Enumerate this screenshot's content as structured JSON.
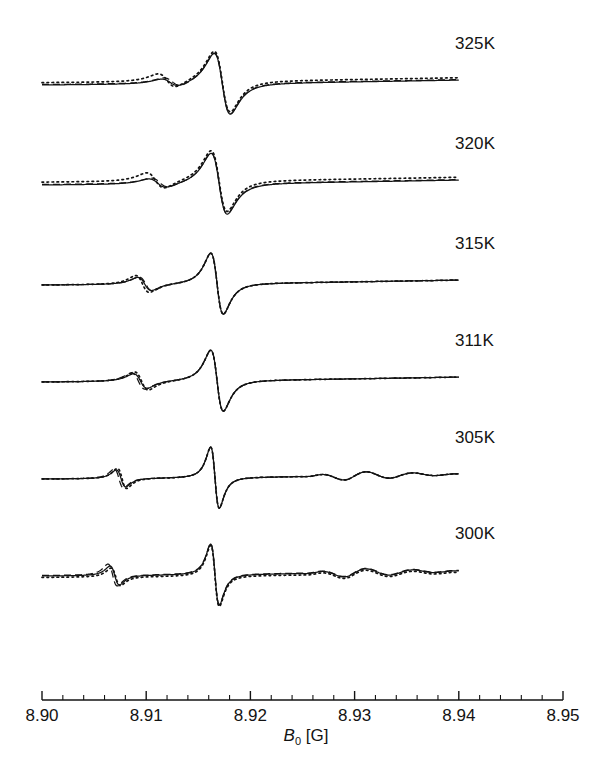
{
  "figure": {
    "kind": "epr-derivative-spectra-stack",
    "background": "#ffffff",
    "ink": "#131313"
  },
  "axis": {
    "title_symbol": "B",
    "title_sub": "0",
    "title_unit": "[G]",
    "title_plain": "B0 [G]",
    "tick_labels": [
      "8.90",
      "8.91",
      "8.92",
      "8.93",
      "8.94",
      "8.95"
    ],
    "tick_values": [
      8.9,
      8.91,
      8.92,
      8.93,
      8.94,
      8.95
    ],
    "minor_tick_step": 0.002,
    "minor_ticks_between_majors": 4,
    "range": [
      8.9,
      8.95
    ],
    "tick_direction": "up",
    "line_color": "#131313"
  },
  "legend": {
    "styles": [
      {
        "name": "experiment",
        "dash": "solid"
      },
      {
        "name": "simulation-a",
        "dash": "dashed"
      },
      {
        "name": "simulation-b",
        "dash": "dotted"
      }
    ]
  },
  "panels": [
    {
      "label": "325K",
      "label_x": 455,
      "label_y": 34,
      "baseline_y": 85
    },
    {
      "label": "320K",
      "label_x": 455,
      "label_y": 134,
      "baseline_y": 185
    },
    {
      "label": "315K",
      "label_x": 455,
      "label_y": 234,
      "baseline_y": 285
    },
    {
      "label": "311K",
      "label_x": 455,
      "label_y": 331,
      "baseline_y": 382
    },
    {
      "label": "305K",
      "label_x": 455,
      "label_y": 428,
      "baseline_y": 479
    },
    {
      "label": "300K",
      "label_x": 455,
      "label_y": 524,
      "baseline_y": 576
    }
  ],
  "chart_data": {
    "type": "line",
    "title": "",
    "xlabel": "B0 [G]",
    "ylabel": "",
    "xlim": [
      8.9,
      8.95
    ],
    "grid": false,
    "legend_position": "none",
    "x_tick_values": [
      8.9,
      8.91,
      8.92,
      8.93,
      8.94,
      8.95
    ],
    "x_tick_labels": [
      "8.90",
      "8.91",
      "8.92",
      "8.93",
      "8.94",
      "8.95"
    ],
    "trace_x_start": 8.9,
    "trace_x_end": 8.94,
    "series": [
      {
        "name": "325K",
        "temperature_K": 325,
        "main_peak_x": 8.9153,
        "main_zero_x": 8.9173,
        "main_trough_x": 8.9192,
        "satellite_peak_x": 8.911,
        "satellite_amplitude": 0.16,
        "main_amplitude": 1.0,
        "linewidth_class": "broad",
        "styles": {
          "solid": {
            "satellite_amplitude": 0.13,
            "satellite_peak_x": 8.9108,
            "baseline_offset": 0.0
          },
          "dashed": {
            "satellite_amplitude": 0.15,
            "satellite_peak_x": 8.911,
            "baseline_offset": 0.01
          },
          "dotted": {
            "satellite_amplitude": 0.23,
            "satellite_peak_x": 8.9105,
            "baseline_offset": 0.05
          }
        }
      },
      {
        "name": "320K",
        "temperature_K": 320,
        "main_peak_x": 8.915,
        "main_zero_x": 8.917,
        "main_trough_x": 8.919,
        "satellite_peak_x": 8.9098,
        "satellite_amplitude": 0.18,
        "main_amplitude": 1.0,
        "linewidth_class": "broad",
        "styles": {
          "solid": {
            "satellite_amplitude": 0.15,
            "satellite_peak_x": 8.9096,
            "baseline_offset": 0.0
          },
          "dashed": {
            "satellite_amplitude": 0.16,
            "satellite_peak_x": 8.9098,
            "baseline_offset": 0.01
          },
          "dotted": {
            "satellite_amplitude": 0.26,
            "satellite_peak_x": 8.9094,
            "baseline_offset": 0.06
          }
        }
      },
      {
        "name": "315K",
        "temperature_K": 315,
        "main_peak_x": 8.9152,
        "main_zero_x": 8.9168,
        "main_trough_x": 8.9186,
        "satellite_peak_x": 8.9088,
        "satellite_amplitude": 0.24,
        "main_amplitude": 1.0,
        "linewidth_class": "medium",
        "styles": {
          "solid": {
            "satellite_amplitude": 0.22,
            "satellite_peak_x": 8.9087,
            "baseline_offset": 0.0
          },
          "dashed": {
            "satellite_amplitude": 0.23,
            "satellite_peak_x": 8.9088,
            "baseline_offset": 0.0
          },
          "dotted": {
            "satellite_amplitude": 0.28,
            "satellite_peak_x": 8.9085,
            "baseline_offset": 0.0
          }
        }
      },
      {
        "name": "311K",
        "temperature_K": 311,
        "main_peak_x": 8.9154,
        "main_zero_x": 8.9168,
        "main_trough_x": 8.9184,
        "satellite_peak_x": 8.9083,
        "satellite_amplitude": 0.27,
        "main_amplitude": 1.0,
        "linewidth_class": "medium",
        "styles": {
          "solid": {
            "satellite_amplitude": 0.24,
            "satellite_peak_x": 8.9083,
            "baseline_offset": 0.0
          },
          "dashed": {
            "satellite_amplitude": 0.27,
            "satellite_peak_x": 8.9081,
            "baseline_offset": 0.0
          },
          "dotted": {
            "satellite_amplitude": 0.3,
            "satellite_peak_x": 8.9084,
            "baseline_offset": 0.0
          }
        }
      },
      {
        "name": "305K",
        "temperature_K": 305,
        "main_peak_x": 8.9156,
        "main_zero_x": 8.9166,
        "main_trough_x": 8.918,
        "satellite_peak_x": 8.9068,
        "satellite_amplitude": 0.3,
        "main_amplitude": 1.0,
        "linewidth_class": "narrow",
        "ripples": true,
        "styles": {
          "solid": {
            "satellite_amplitude": 0.28,
            "satellite_peak_x": 8.9068,
            "baseline_offset": 0.0
          },
          "dashed": {
            "satellite_amplitude": 0.31,
            "satellite_peak_x": 8.9066,
            "baseline_offset": 0.0
          },
          "dotted": {
            "satellite_amplitude": 0.33,
            "satellite_peak_x": 8.9069,
            "baseline_offset": 0.0
          }
        }
      },
      {
        "name": "300K",
        "temperature_K": 300,
        "main_peak_x": 8.9158,
        "main_zero_x": 8.9166,
        "main_trough_x": 8.9178,
        "satellite_peak_x": 8.9062,
        "satellite_amplitude": 0.33,
        "main_amplitude": 1.0,
        "linewidth_class": "narrow",
        "ripples": true,
        "styles": {
          "solid": {
            "satellite_amplitude": 0.31,
            "satellite_peak_x": 8.9062,
            "baseline_offset": 0.0
          },
          "dashed": {
            "satellite_amplitude": 0.36,
            "satellite_peak_x": 8.906,
            "baseline_offset": 0.01
          },
          "dotted": {
            "satellite_amplitude": 0.29,
            "satellite_peak_x": 8.9063,
            "baseline_offset": -0.03
          }
        }
      }
    ]
  }
}
